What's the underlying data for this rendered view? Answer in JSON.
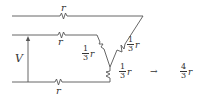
{
  "diagram": {
    "type": "circuit",
    "source_label": "V",
    "resistors": [
      {
        "id": "top",
        "label": "r"
      },
      {
        "id": "middle-left",
        "label": "r"
      },
      {
        "id": "bottom",
        "label": "r"
      },
      {
        "id": "diag-right",
        "num": "1",
        "den": "3",
        "var": "r"
      },
      {
        "id": "diag-left",
        "num": "1",
        "den": "3",
        "var": "r"
      },
      {
        "id": "vertical-lower",
        "num": "1",
        "den": "3",
        "var": "r"
      }
    ],
    "arrow": "→",
    "result": {
      "num": "4",
      "den": "3",
      "var": "r"
    },
    "colors": {
      "wire": "#555555",
      "text": "#333333"
    }
  }
}
